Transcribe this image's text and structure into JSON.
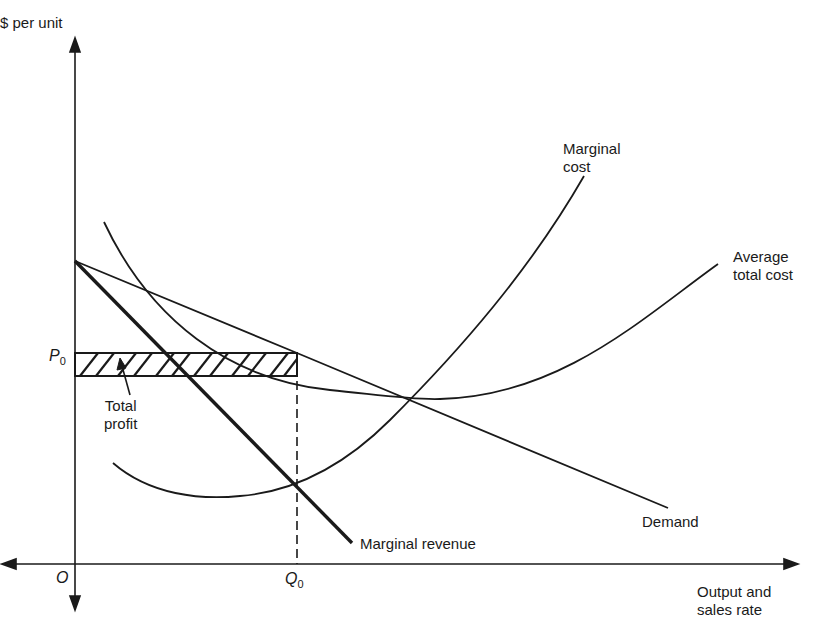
{
  "diagram": {
    "y_axis_label": "$ per unit",
    "x_axis_label_line1": "Output and",
    "x_axis_label_line2": "sales rate",
    "origin_label": "O",
    "price_label": "P",
    "price_sub": "0",
    "quantity_label": "Q",
    "quantity_sub": "0",
    "curves": {
      "marginal_cost_line1": "Marginal",
      "marginal_cost_line2": "cost",
      "average_total_cost_line1": "Average",
      "average_total_cost_line2": "total cost",
      "demand": "Demand",
      "marginal_revenue": "Marginal revenue"
    },
    "profit_label_line1": "Total",
    "profit_label_line2": "profit",
    "colors": {
      "ink": "#1a1a1a",
      "background": "#ffffff"
    }
  }
}
